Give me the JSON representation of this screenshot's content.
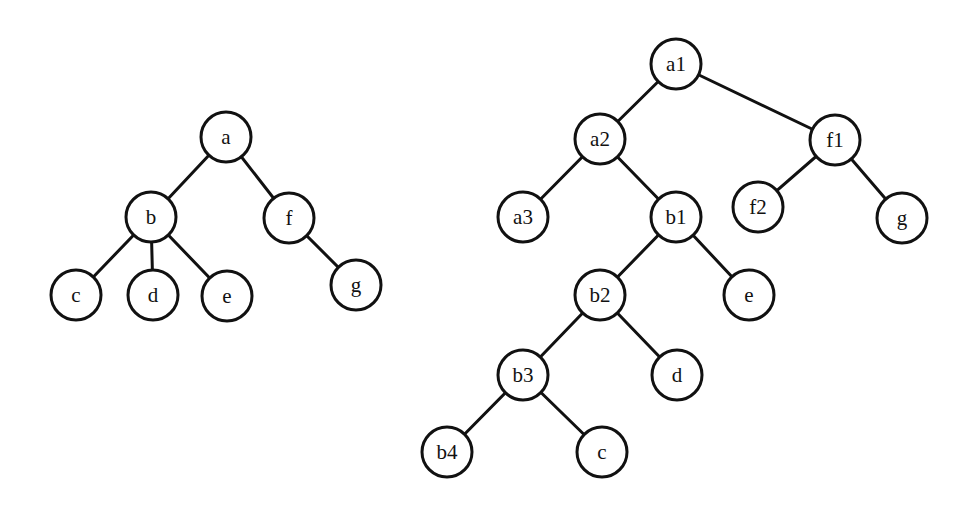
{
  "trees": [
    {
      "name": "original-tree",
      "nodes": [
        {
          "id": "a",
          "label": "a",
          "x": 226,
          "y": 137
        },
        {
          "id": "b",
          "label": "b",
          "x": 151,
          "y": 217
        },
        {
          "id": "f",
          "label": "f",
          "x": 289,
          "y": 218
        },
        {
          "id": "c",
          "label": "c",
          "x": 76,
          "y": 295
        },
        {
          "id": "d",
          "label": "d",
          "x": 153,
          "y": 295
        },
        {
          "id": "e",
          "label": "e",
          "x": 227,
          "y": 296
        },
        {
          "id": "g",
          "label": "g",
          "x": 356,
          "y": 285
        }
      ],
      "edges": [
        [
          "a",
          "b"
        ],
        [
          "a",
          "f"
        ],
        [
          "b",
          "c"
        ],
        [
          "b",
          "d"
        ],
        [
          "b",
          "e"
        ],
        [
          "f",
          "g"
        ]
      ]
    },
    {
      "name": "binarized-tree",
      "nodes": [
        {
          "id": "a1",
          "label": "a1",
          "x": 676,
          "y": 64
        },
        {
          "id": "a2",
          "label": "a2",
          "x": 600,
          "y": 139
        },
        {
          "id": "f1",
          "label": "f1",
          "x": 835,
          "y": 140
        },
        {
          "id": "a3",
          "label": "a3",
          "x": 523,
          "y": 217
        },
        {
          "id": "b1",
          "label": "b1",
          "x": 676,
          "y": 217
        },
        {
          "id": "f2",
          "label": "f2",
          "x": 758,
          "y": 207
        },
        {
          "id": "g",
          "label": "g",
          "x": 902,
          "y": 218
        },
        {
          "id": "b2",
          "label": "b2",
          "x": 600,
          "y": 295
        },
        {
          "id": "e",
          "label": "e",
          "x": 749,
          "y": 295
        },
        {
          "id": "b3",
          "label": "b3",
          "x": 523,
          "y": 375
        },
        {
          "id": "d",
          "label": "d",
          "x": 677,
          "y": 375
        },
        {
          "id": "b4",
          "label": "b4",
          "x": 447,
          "y": 452
        },
        {
          "id": "c",
          "label": "c",
          "x": 602,
          "y": 452
        }
      ],
      "edges": [
        [
          "a1",
          "a2"
        ],
        [
          "a1",
          "f1"
        ],
        [
          "a2",
          "a3"
        ],
        [
          "a2",
          "b1"
        ],
        [
          "f1",
          "f2"
        ],
        [
          "f1",
          "g"
        ],
        [
          "b1",
          "b2"
        ],
        [
          "b1",
          "e"
        ],
        [
          "b2",
          "b3"
        ],
        [
          "b2",
          "d"
        ],
        [
          "b3",
          "b4"
        ],
        [
          "b3",
          "c"
        ]
      ]
    }
  ],
  "node_radius": 25
}
